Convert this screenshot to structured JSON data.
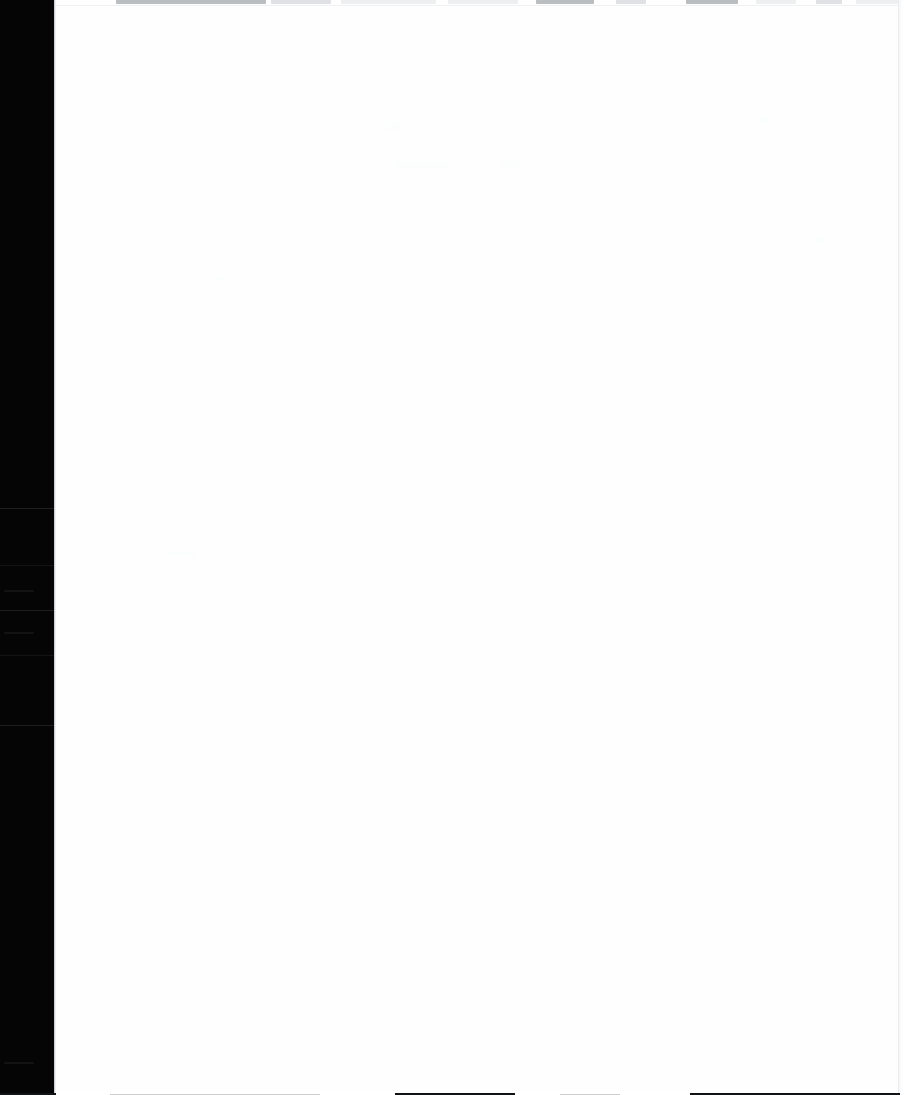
{
  "window": {
    "title": "Blank Document Canvas",
    "width": 904,
    "height": 1095,
    "state": "Content area is blank — no rendered text or graphics"
  },
  "colors": {
    "rail_background": "#050505",
    "rail_separator": "#242424",
    "canvas_background": "#fefeff",
    "divider": "#b9bcc0",
    "toolbar_sliver": "#c6c9cd",
    "bottom_rule": "#111315",
    "right_edge": "#eaebed"
  },
  "activity_rail": {
    "name": "left-activity-rail",
    "x": 0,
    "width": 54,
    "height": 1095,
    "separators": [
      {
        "y": 508
      },
      {
        "y": 565
      },
      {
        "y": 610
      },
      {
        "y": 655
      },
      {
        "y": 725
      }
    ],
    "marks": [
      {
        "y": 590,
        "label": ""
      },
      {
        "y": 632,
        "label": ""
      },
      {
        "y": 1062,
        "label": ""
      }
    ]
  },
  "toolbar_sliver": {
    "name": "clipped-toolbar-strip",
    "height": 7,
    "note": "Bottom edge of an off-screen toolbar row",
    "chunks": [
      {
        "left": 60,
        "width": 150,
        "tone": "dark"
      },
      {
        "left": 215,
        "width": 60,
        "tone": "mid"
      },
      {
        "left": 285,
        "width": 95,
        "tone": "light"
      },
      {
        "left": 392,
        "width": 70,
        "tone": "light"
      },
      {
        "left": 480,
        "width": 58,
        "tone": "dark"
      },
      {
        "left": 560,
        "width": 30,
        "tone": "mid"
      },
      {
        "left": 630,
        "width": 52,
        "tone": "dark"
      },
      {
        "left": 700,
        "width": 40,
        "tone": "light"
      },
      {
        "left": 760,
        "width": 26,
        "tone": "mid"
      },
      {
        "left": 800,
        "width": 44,
        "tone": "light"
      }
    ]
  },
  "canvas": {
    "name": "document-canvas",
    "x": 56,
    "y": 7,
    "width": 842,
    "height": 1084,
    "content": "",
    "ghosts": [
      {
        "left": 330,
        "top": 115,
        "width": 14,
        "height": 8
      },
      {
        "left": 700,
        "top": 110,
        "width": 16,
        "height": 6
      },
      {
        "left": 340,
        "top": 155,
        "width": 52,
        "height": 7
      },
      {
        "left": 445,
        "top": 152,
        "width": 18,
        "height": 8
      },
      {
        "left": 160,
        "top": 268,
        "width": 10,
        "height": 6
      },
      {
        "left": 760,
        "top": 230,
        "width": 12,
        "height": 6
      },
      {
        "left": 110,
        "top": 545,
        "width": 30,
        "height": 5
      },
      {
        "left": 860,
        "top": 420,
        "width": 12,
        "height": 5
      }
    ]
  },
  "right_edge": {
    "name": "window-right-edge",
    "x": 898,
    "width": 6
  },
  "bottom_rule": {
    "name": "bottom-window-rule",
    "segments": [
      {
        "left": 0,
        "width": 56,
        "tone": "strong"
      },
      {
        "left": 110,
        "width": 210,
        "tone": "soft"
      },
      {
        "left": 395,
        "width": 120,
        "tone": "strong"
      },
      {
        "left": 560,
        "width": 60,
        "tone": "soft"
      },
      {
        "left": 690,
        "width": 210,
        "tone": "strong"
      }
    ]
  }
}
